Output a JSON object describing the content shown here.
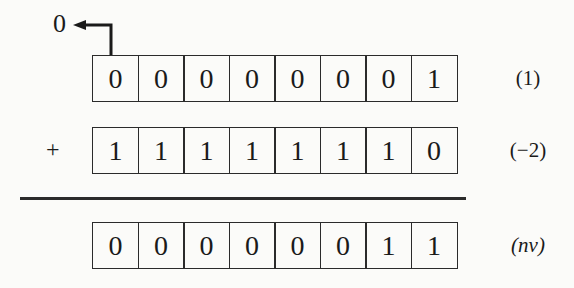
{
  "figure": {
    "carry_out": {
      "value": "0"
    },
    "operator": "+",
    "rows": [
      {
        "bits": [
          "0",
          "0",
          "0",
          "0",
          "0",
          "0",
          "0",
          "1"
        ],
        "label": "(1)"
      },
      {
        "bits": [
          "1",
          "1",
          "1",
          "1",
          "1",
          "1",
          "1",
          "0"
        ],
        "label": "(−2)"
      },
      {
        "bits": [
          "0",
          "0",
          "0",
          "0",
          "0",
          "0",
          "1",
          "1"
        ],
        "label": "(nv)"
      }
    ]
  },
  "colors": {
    "background": "#fbfbf9",
    "line": "#2b2b2b",
    "text": "#1a1a1a"
  }
}
